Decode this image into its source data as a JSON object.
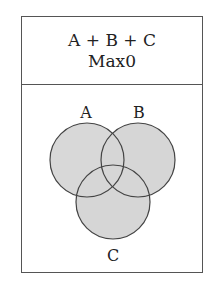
{
  "header": {
    "expression": "A + B + C",
    "result": "Max0"
  },
  "diagram": {
    "type": "venn",
    "fill_color": "#d6d6d6",
    "stroke_color": "#444444",
    "sets": [
      {
        "label": "A",
        "cx": 87,
        "cy": 160,
        "r": 37,
        "label_x": 86,
        "label_y": 118
      },
      {
        "label": "B",
        "cx": 138,
        "cy": 160,
        "r": 37,
        "label_x": 139,
        "label_y": 118
      },
      {
        "label": "C",
        "cx": 113,
        "cy": 202,
        "r": 37,
        "label_x": 113,
        "label_y": 261
      }
    ]
  }
}
